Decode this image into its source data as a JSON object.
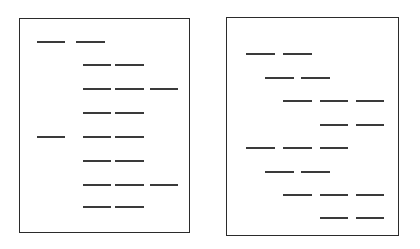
{
  "figure": {
    "background_color": "#ffffff",
    "stroke_color": "#2b2b2b",
    "dash_color": "#3a3a3a",
    "width": 420,
    "height": 249
  },
  "panels": [
    {
      "id": "left-page",
      "name": "Left page",
      "x": 19,
      "y": 18,
      "width": 171,
      "height": 215,
      "border_color": "#2b2b2b",
      "border_width": 1.4,
      "rows": [
        {
          "index": 1,
          "y": 41,
          "segments": [
            {
              "x": 37,
              "w": 28
            },
            {
              "x": 76,
              "w": 29
            }
          ]
        },
        {
          "index": 2,
          "y": 64,
          "segments": [
            {
              "x": 83,
              "w": 28
            },
            {
              "x": 115,
              "w": 29
            }
          ]
        },
        {
          "index": 3,
          "y": 88,
          "segments": [
            {
              "x": 83,
              "w": 28
            },
            {
              "x": 115,
              "w": 29
            },
            {
              "x": 150,
              "w": 28
            }
          ]
        },
        {
          "index": 4,
          "y": 112,
          "segments": [
            {
              "x": 83,
              "w": 28
            },
            {
              "x": 115,
              "w": 29
            }
          ]
        },
        {
          "index": 5,
          "y": 136,
          "segments": [
            {
              "x": 37,
              "w": 28
            },
            {
              "x": 83,
              "w": 28
            },
            {
              "x": 115,
              "w": 29
            }
          ]
        },
        {
          "index": 6,
          "y": 160,
          "segments": [
            {
              "x": 83,
              "w": 28
            },
            {
              "x": 115,
              "w": 29
            }
          ]
        },
        {
          "index": 7,
          "y": 184,
          "segments": [
            {
              "x": 83,
              "w": 28
            },
            {
              "x": 115,
              "w": 29
            },
            {
              "x": 150,
              "w": 28
            }
          ]
        },
        {
          "index": 8,
          "y": 206,
          "segments": [
            {
              "x": 83,
              "w": 28
            },
            {
              "x": 115,
              "w": 29
            }
          ]
        }
      ]
    },
    {
      "id": "right-page",
      "name": "Right page",
      "x": 226,
      "y": 17,
      "width": 173,
      "height": 219,
      "border_color": "#2b2b2b",
      "border_width": 1.4,
      "rows": [
        {
          "index": 1,
          "y": 53,
          "segments": [
            {
              "x": 246,
              "w": 29
            },
            {
              "x": 283,
              "w": 29
            }
          ]
        },
        {
          "index": 2,
          "y": 77,
          "segments": [
            {
              "x": 265,
              "w": 29
            },
            {
              "x": 301,
              "w": 29
            }
          ]
        },
        {
          "index": 3,
          "y": 100,
          "segments": [
            {
              "x": 283,
              "w": 29
            },
            {
              "x": 320,
              "w": 28
            },
            {
              "x": 356,
              "w": 28
            }
          ]
        },
        {
          "index": 4,
          "y": 124,
          "segments": [
            {
              "x": 320,
              "w": 28
            },
            {
              "x": 356,
              "w": 28
            }
          ]
        },
        {
          "index": 5,
          "y": 147,
          "segments": [
            {
              "x": 246,
              "w": 29
            },
            {
              "x": 283,
              "w": 29
            },
            {
              "x": 320,
              "w": 28
            }
          ]
        },
        {
          "index": 6,
          "y": 171,
          "segments": [
            {
              "x": 265,
              "w": 29
            },
            {
              "x": 301,
              "w": 29
            }
          ]
        },
        {
          "index": 7,
          "y": 194,
          "segments": [
            {
              "x": 283,
              "w": 29
            },
            {
              "x": 320,
              "w": 28
            },
            {
              "x": 356,
              "w": 28
            }
          ]
        },
        {
          "index": 8,
          "y": 217,
          "segments": [
            {
              "x": 320,
              "w": 28
            },
            {
              "x": 356,
              "w": 28
            }
          ]
        }
      ]
    }
  ]
}
